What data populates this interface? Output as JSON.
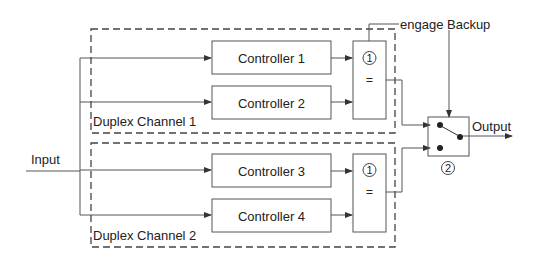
{
  "diagram": {
    "input_label": "Input",
    "output_label": "Output",
    "engage_label": "engage Backup",
    "channels": [
      {
        "label": "Duplex Channel 1",
        "controllers": [
          "Controller 1",
          "Controller 2"
        ],
        "comparator_number": "1",
        "comparator_symbol": "="
      },
      {
        "label": "Duplex Channel 2",
        "controllers": [
          "Controller 3",
          "Controller 4"
        ],
        "comparator_number": "1",
        "comparator_symbol": "="
      }
    ],
    "switch_number": "2"
  },
  "colors": {
    "line": "#444444",
    "text": "#222222",
    "background": "#ffffff"
  }
}
